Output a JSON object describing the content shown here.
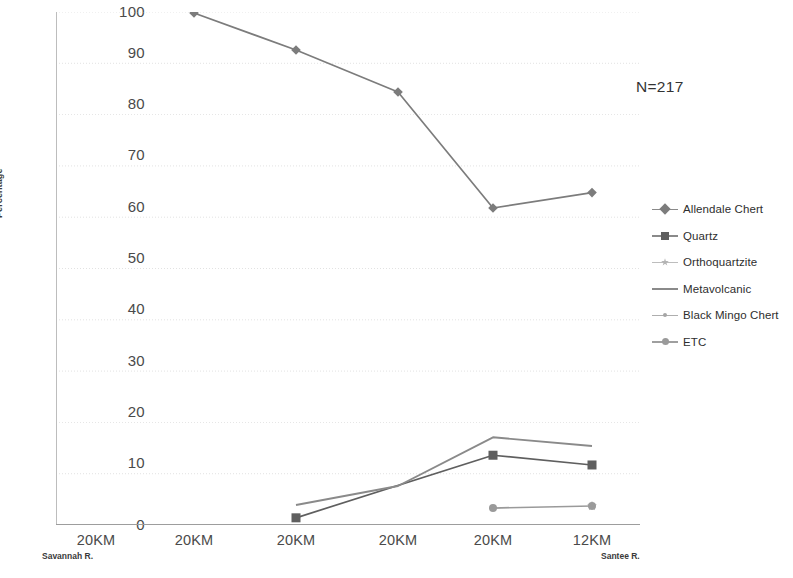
{
  "annotation": {
    "sample_size": "N=217"
  },
  "axes": {
    "ylabel": "Percentage",
    "y_ticks": [
      "100",
      "90",
      "80",
      "70",
      "60",
      "50",
      "40",
      "30",
      "20",
      "10",
      "0"
    ],
    "x_ticks": [
      "20KM",
      "20KM",
      "20KM",
      "20KM",
      "20KM",
      "12KM"
    ],
    "x_sub_left": "Savannah R.",
    "x_sub_right": "Santee R."
  },
  "legend": {
    "items": [
      {
        "label": "Allendale Chert",
        "marker": "diamond",
        "color": "#7c7c7c"
      },
      {
        "label": "Quartz",
        "marker": "square",
        "color": "#5f5f5f"
      },
      {
        "label": "Orthoquartzite",
        "marker": "star",
        "color": "#b4b4b4"
      },
      {
        "label": "Metavolcanic",
        "marker": "none",
        "color": "#8a8a8a"
      },
      {
        "label": "Black Mingo Chert",
        "marker": "dot",
        "color": "#a5a5a5"
      },
      {
        "label": "ETC",
        "marker": "circle",
        "color": "#9a9a9a"
      }
    ]
  },
  "chart_data": {
    "type": "line",
    "title": "",
    "xlabel": "",
    "ylabel": "Percentage",
    "ylim": [
      0,
      100
    ],
    "ytick_step": 10,
    "grid": true,
    "legend_position": "right",
    "annotations": [
      "N=217"
    ],
    "categories": [
      "20KM",
      "20KM",
      "20KM",
      "20KM",
      "20KM",
      "12KM"
    ],
    "category_endpoints": {
      "left": "Savannah R.",
      "right": "Santee R."
    },
    "series": [
      {
        "name": "Allendale Chert",
        "marker": "diamond",
        "color": "#7c7c7c",
        "values": [
          null,
          99.8,
          92.6,
          84.4,
          61.8,
          64.8
        ]
      },
      {
        "name": "Quartz",
        "marker": "square",
        "color": "#5f5f5f",
        "values": [
          null,
          null,
          1.4,
          null,
          13.6,
          11.7
        ]
      },
      {
        "name": "Orthoquartzite",
        "marker": "star",
        "color": "#b4b4b4",
        "values": [
          null,
          null,
          null,
          null,
          null,
          3.7
        ]
      },
      {
        "name": "Metavolcanic",
        "marker": "none",
        "color": "#8a8a8a",
        "values": [
          null,
          null,
          3.9,
          7.6,
          17.1,
          15.4
        ]
      },
      {
        "name": "Black Mingo Chert",
        "marker": "dot",
        "color": "#a5a5a5",
        "values": [
          null,
          null,
          null,
          null,
          null,
          null
        ]
      },
      {
        "name": "ETC",
        "marker": "circle",
        "color": "#9a9a9a",
        "values": [
          null,
          null,
          null,
          null,
          3.3,
          3.7
        ]
      }
    ]
  }
}
